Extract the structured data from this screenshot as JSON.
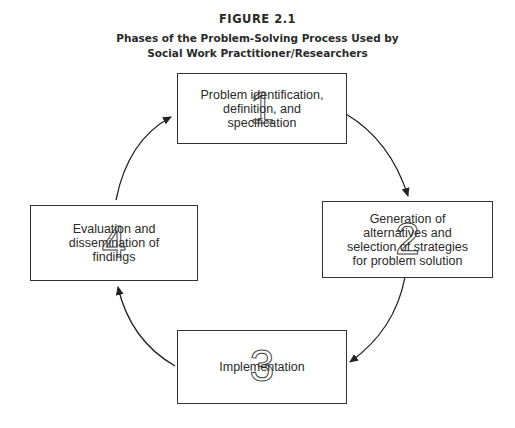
{
  "figure": {
    "label": "FIGURE 2.1",
    "title_line1": "Phases of the Problem-Solving Process Used by",
    "title_line2": "Social Work Practitioner/Researchers"
  },
  "phases": [
    {
      "number": "1",
      "lines": [
        "Problem identification,",
        "definition, and",
        "specification"
      ]
    },
    {
      "number": "2",
      "lines": [
        "Generation of",
        "alternatives and",
        "selection of strategies",
        "for problem solution"
      ]
    },
    {
      "number": "3",
      "lines": [
        "Implementation"
      ]
    },
    {
      "number": "4",
      "lines": [
        "Evaluation and",
        "dissemination of",
        "findings"
      ]
    }
  ],
  "flow": [
    "1 → 2",
    "2 → 3",
    "3 → 4",
    "4 → 1"
  ]
}
